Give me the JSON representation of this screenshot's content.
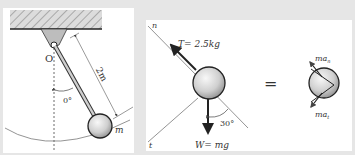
{
  "pendulum": {
    "pivot_label": "O",
    "length_label": "2m",
    "angle_label": "0°",
    "mass_label": "m"
  },
  "free_body": {
    "normal_axis_label": "n",
    "tangent_axis_label": "t",
    "tension_label": "T= 2.5kg",
    "weight_label": "W= mg",
    "angle_label": "30°"
  },
  "equals_sign": "=",
  "kinetic": {
    "normal_accel_label": "ma",
    "normal_accel_sub": "n",
    "tangent_accel_label": "ma",
    "tangent_accel_sub": "t"
  },
  "colors": {
    "background": "#e6e6e6",
    "panel": "#ffffff",
    "line": "#333333",
    "ball_light": "#f4f4f4",
    "ball_dark": "#9a9a9a"
  }
}
